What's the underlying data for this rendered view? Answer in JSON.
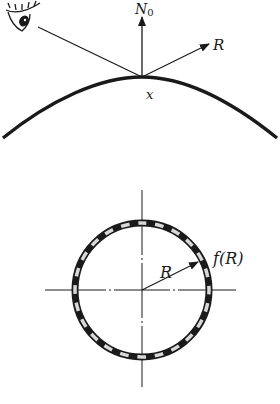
{
  "figure_top": {
    "title": "Reflection at surface point",
    "labels": {
      "normal": "N",
      "normal_subscript": "0",
      "reflection": "R",
      "point": "x"
    },
    "icons": [
      "eye-icon"
    ]
  },
  "figure_bottom": {
    "title": "Circular map of reflection direction",
    "labels": {
      "radius": "R",
      "function": "f(R)"
    },
    "ring_segments": 24
  },
  "colors": {
    "ink": "#1a1a1a",
    "ring_light": "#d8d8d8",
    "background": "#ffffff"
  }
}
